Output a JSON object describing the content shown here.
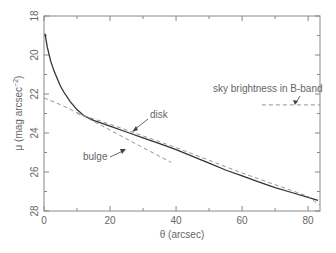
{
  "chart_data": {
    "type": "line",
    "title": "",
    "xlabel": "θ (arcsec)",
    "ylabel": "μ (mag arcsec⁻²)",
    "xlim": [
      0,
      83.6
    ],
    "ylim": [
      28,
      18
    ],
    "y_inverted": true,
    "x_ticks": [
      0,
      20,
      40,
      60,
      80
    ],
    "x_minor_ticks": [
      10,
      30,
      50,
      70
    ],
    "y_ticks": [
      18,
      20,
      22,
      24,
      26,
      28
    ],
    "y_minor_ticks": [
      19,
      21,
      23,
      25,
      27
    ],
    "grid": false,
    "legend": null,
    "series": [
      {
        "name": "observed profile",
        "style": "solid",
        "x": [
          0.3,
          1,
          2,
          3,
          4,
          5,
          6,
          8,
          10,
          12,
          15,
          20,
          25,
          30,
          35,
          40,
          45,
          50,
          55,
          60,
          65,
          70,
          75,
          80,
          83
        ],
        "y": [
          18.9,
          19.6,
          20.3,
          20.8,
          21.2,
          21.6,
          21.9,
          22.4,
          22.8,
          23.1,
          23.35,
          23.65,
          23.95,
          24.25,
          24.55,
          24.85,
          25.2,
          25.55,
          25.9,
          26.2,
          26.5,
          26.8,
          27.05,
          27.3,
          27.45
        ]
      },
      {
        "name": "bulge",
        "style": "dashed",
        "x": [
          0,
          5,
          10,
          15,
          20,
          25,
          30,
          35,
          38.5
        ],
        "y": [
          22.2,
          22.55,
          22.95,
          23.4,
          23.85,
          24.3,
          24.75,
          25.2,
          25.5
        ]
      },
      {
        "name": "disk",
        "style": "dashed",
        "x": [
          10,
          20,
          30,
          40,
          50,
          60,
          70,
          80,
          83.5
        ],
        "y": [
          23.0,
          23.55,
          24.15,
          24.75,
          25.4,
          26.05,
          26.65,
          27.25,
          27.7
        ]
      },
      {
        "name": "sky brightness in B-band",
        "style": "dashed",
        "x": [
          66,
          83.6
        ],
        "y": [
          22.56,
          22.56
        ]
      }
    ],
    "annotations": [
      {
        "text": "disk",
        "x": 33,
        "y": 23.3,
        "arrow_to": [
          27,
          24.05
        ]
      },
      {
        "text": "bulge",
        "x": 15,
        "y": 25.5,
        "arrow_to": [
          23,
          24.75
        ]
      },
      {
        "text": "sky brightness in B-band",
        "x": 62,
        "y": 21.6,
        "arrow_to": [
          76,
          22.56
        ]
      }
    ]
  },
  "labels": {
    "xlabel": "θ (arcsec)",
    "ylabel_main": "μ (mag arcsec",
    "ylabel_sup": "−2",
    "ylabel_close": ")",
    "annot_disk": "disk",
    "annot_bulge": "bulge",
    "annot_sky": "sky brightness in B-band",
    "xtick_0": "0",
    "xtick_20": "20",
    "xtick_40": "40",
    "xtick_60": "60",
    "xtick_80": "80",
    "ytick_18": "18",
    "ytick_20": "20",
    "ytick_22": "22",
    "ytick_24": "24",
    "ytick_26": "26",
    "ytick_28": "28"
  },
  "colors": {
    "axis": "#888888",
    "curve": "#333333",
    "dashed": "#888888",
    "text": "#666666"
  }
}
